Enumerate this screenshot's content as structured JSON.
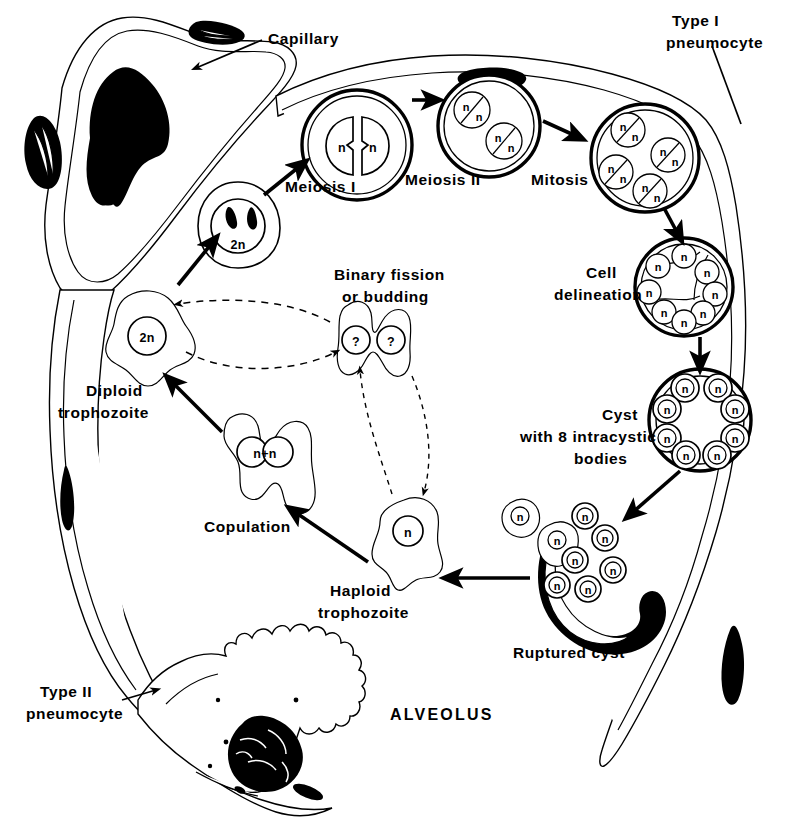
{
  "figure": {
    "center_label": "ALVEOLUS",
    "background_color": "#ffffff",
    "ink_color": "#000000"
  },
  "anatomy": [
    {
      "id": "capillary",
      "label": "Capillary",
      "label_x": 268,
      "label_y": 38,
      "note": "stippled vessel wall upper left"
    },
    {
      "id": "rbc",
      "label": "rbc",
      "label_x": 125,
      "label_y": 112,
      "note": "solid black red blood cell inside capillary"
    },
    {
      "id": "type-i-pneumocyte",
      "label_line1": "Type I",
      "label_line2": "pneumocyte",
      "label_x": 668,
      "label_y": 22,
      "note": "thin stippled band along top and right"
    },
    {
      "id": "type-ii-pneumocyte",
      "label_line1": "Type II",
      "label_line2": "pneumocyte",
      "label_x": 40,
      "label_y": 686,
      "note": "cuboidal cell with microvilli, lower left"
    }
  ],
  "stages": [
    {
      "id": "diploid-trophozoite",
      "label_line1": "Diploid",
      "label_line2": "trophozoite",
      "nucleus": "2n",
      "x": 144,
      "y": 335,
      "label_x": 88,
      "label_y": 393
    },
    {
      "id": "precyst-2n",
      "label": "",
      "nucleus": "2n",
      "x": 238,
      "y": 222,
      "note": "rounded precyst entering meiosis"
    },
    {
      "id": "meiosis-i",
      "label": "Meiosis I",
      "nucleus": "n / n",
      "x": 357,
      "y": 145,
      "label_x": 285,
      "label_y": 188,
      "bodies": 1
    },
    {
      "id": "meiosis-ii",
      "label": "Meiosis II",
      "nucleus": "n",
      "x": 489,
      "y": 126,
      "label_x": 437,
      "label_y": 180,
      "bodies": 2
    },
    {
      "id": "mitosis",
      "label": "Mitosis",
      "nucleus": "n",
      "x": 645,
      "y": 158,
      "label_x": 537,
      "label_y": 180,
      "bodies": 4
    },
    {
      "id": "cell-delineation",
      "label_line1": "Cell",
      "label_line2": "delineation",
      "nucleus": "n",
      "x": 684,
      "y": 287,
      "label_x": 561,
      "label_y": 280,
      "bodies": 8
    },
    {
      "id": "mature-cyst",
      "label_line1": "Cyst",
      "label_line2": "with 8 intracystic",
      "label_line3": "bodies",
      "nucleus": "n",
      "x": 700,
      "y": 420,
      "label_x": 588,
      "label_y": 423,
      "bodies": 8
    },
    {
      "id": "ruptured-cyst",
      "label": "Ruptured cyst",
      "nucleus": "n",
      "x": 600,
      "y": 560,
      "label_x": 700,
      "label_y": 652,
      "released_bodies": 6,
      "released_trophozoites": 2
    },
    {
      "id": "haploid-trophozoite",
      "label_line1": "Haploid",
      "label_line2": "trophozoite",
      "nucleus": "n",
      "x": 407,
      "y": 538,
      "label_x": 389,
      "label_y": 596
    },
    {
      "id": "copulation",
      "label": "Copulation",
      "nucleus": "n+n",
      "x": 262,
      "y": 452,
      "label_x": 224,
      "label_y": 527
    },
    {
      "id": "binary-fission",
      "label_line1": "Binary fission",
      "label_line2": "or budding",
      "nucleus": "?",
      "x": 374,
      "y": 338,
      "label_x": 332,
      "label_y": 276
    }
  ],
  "nucleus_labels": {
    "diploid": "2n",
    "haploid": "n",
    "copulating": "n+n",
    "unknown": "?"
  },
  "arrows": [
    {
      "id": "arrow-diploid-to-precyst",
      "from": "diploid-trophozoite",
      "to": "precyst-2n",
      "style": "solid"
    },
    {
      "id": "arrow-precyst-to-meiosis-i",
      "from": "precyst-2n",
      "to": "meiosis-i",
      "style": "solid"
    },
    {
      "id": "arrow-meiosis-i-to-meiosis-ii",
      "from": "meiosis-i",
      "to": "meiosis-ii",
      "style": "solid"
    },
    {
      "id": "arrow-meiosis-ii-to-mitosis",
      "from": "meiosis-ii",
      "to": "mitosis",
      "style": "solid"
    },
    {
      "id": "arrow-mitosis-to-delineation",
      "from": "mitosis",
      "to": "cell-delineation",
      "style": "solid"
    },
    {
      "id": "arrow-delineation-to-cyst",
      "from": "cell-delineation",
      "to": "mature-cyst",
      "style": "solid"
    },
    {
      "id": "arrow-cyst-to-ruptured",
      "from": "mature-cyst",
      "to": "ruptured-cyst",
      "style": "solid"
    },
    {
      "id": "arrow-ruptured-to-haploid",
      "from": "ruptured-cyst",
      "to": "haploid-trophozoite",
      "style": "solid"
    },
    {
      "id": "arrow-haploid-to-copulation",
      "from": "haploid-trophozoite",
      "to": "copulation",
      "style": "solid"
    },
    {
      "id": "arrow-copulation-to-diploid",
      "from": "copulation",
      "to": "diploid-trophozoite",
      "style": "solid"
    },
    {
      "id": "arrow-diploid-to-fission",
      "from": "diploid-trophozoite",
      "to": "binary-fission",
      "style": "dashed"
    },
    {
      "id": "arrow-fission-to-diploid",
      "from": "binary-fission",
      "to": "diploid-trophozoite",
      "style": "dashed"
    },
    {
      "id": "arrow-haploid-to-fission",
      "from": "haploid-trophozoite",
      "to": "binary-fission",
      "style": "dashed"
    },
    {
      "id": "arrow-fission-to-haploid",
      "from": "binary-fission",
      "to": "haploid-trophozoite",
      "style": "dashed"
    }
  ]
}
